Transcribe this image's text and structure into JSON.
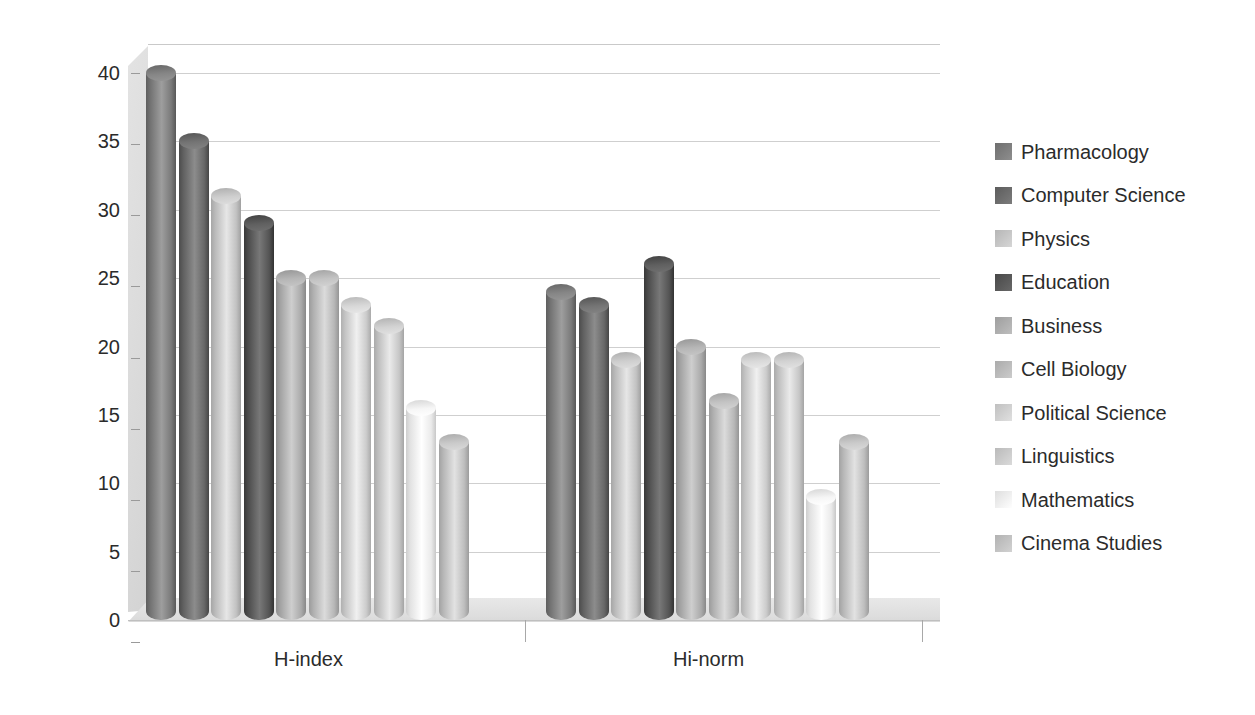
{
  "chart_data": {
    "type": "bar",
    "title": "",
    "subtitle": "",
    "xlabel": "",
    "ylabel": "",
    "categories": [
      "H-index",
      "Hi-norm"
    ],
    "ylim": [
      0,
      40
    ],
    "ytick_step": 5,
    "yticks": [
      "40",
      "35",
      "30",
      "25",
      "20",
      "15",
      "10",
      "5",
      "0"
    ],
    "ytick_values": [
      40,
      35,
      30,
      25,
      20,
      15,
      10,
      5,
      0
    ],
    "grid": "horizontal",
    "legend_position": "right",
    "style": "3d-cylinder-grayscale",
    "series": [
      {
        "name": "Pharmacology",
        "color": "#808080",
        "values": [
          40,
          24
        ]
      },
      {
        "name": "Computer Science",
        "color": "#6e6e6e",
        "values": [
          35,
          23
        ]
      },
      {
        "name": "Physics",
        "color": "#c8c8c8",
        "values": [
          31,
          19
        ]
      },
      {
        "name": "Education",
        "color": "#5a5a5a",
        "values": [
          29,
          26
        ]
      },
      {
        "name": "Business",
        "color": "#b0b0b0",
        "values": [
          25,
          20
        ]
      },
      {
        "name": "Cell Biology",
        "color": "#bdbdbd",
        "values": [
          25,
          16
        ]
      },
      {
        "name": "Political Science",
        "color": "#d2d2d2",
        "values": [
          23,
          19
        ]
      },
      {
        "name": "Linguistics",
        "color": "#cccccc",
        "values": [
          21.5,
          19
        ]
      },
      {
        "name": "Mathematics",
        "color": "#f0f0f0",
        "values": [
          15.5,
          9
        ]
      },
      {
        "name": "Cinema Studies",
        "color": "#c4c4c4",
        "values": [
          13,
          13
        ]
      }
    ]
  },
  "legend": {
    "items": [
      {
        "label": "Pharmacology"
      },
      {
        "label": "Computer Science"
      },
      {
        "label": "Physics"
      },
      {
        "label": "Education"
      },
      {
        "label": "Business"
      },
      {
        "label": "Cell Biology"
      },
      {
        "label": "Political Science"
      },
      {
        "label": "Linguistics"
      },
      {
        "label": "Mathematics"
      },
      {
        "label": "Cinema Studies"
      }
    ]
  },
  "colors": {
    "text": "#2b2b2b",
    "gridline": "#cfcfcf",
    "floor": "#dedede",
    "background": "#ffffff"
  }
}
